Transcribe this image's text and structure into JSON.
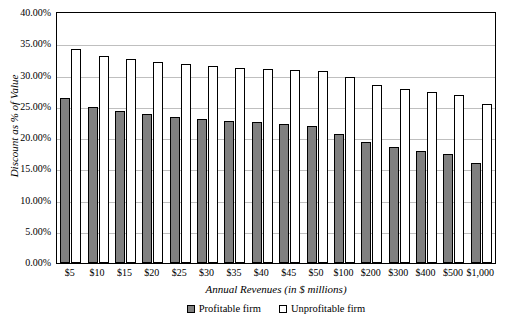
{
  "chart_data": {
    "type": "bar",
    "title": "",
    "xlabel": "Annual Revenues (in $ millions)",
    "ylabel": "Discount as % of Value",
    "categories": [
      "$5",
      "$10",
      "$15",
      "$20",
      "$25",
      "$30",
      "$35",
      "$40",
      "$45",
      "$50",
      "$100",
      "$200",
      "$300",
      "$400",
      "$500",
      "$1,000"
    ],
    "series": [
      {
        "name": "Profitable firm",
        "color": "#808080",
        "values": [
          26.4,
          25.0,
          24.3,
          23.8,
          23.4,
          23.0,
          22.7,
          22.5,
          22.3,
          22.0,
          20.7,
          19.4,
          18.5,
          17.9,
          17.5,
          16.0
        ]
      },
      {
        "name": "Unprofitable firm",
        "color": "#ffffff",
        "values": [
          34.2,
          33.2,
          32.6,
          32.1,
          31.9,
          31.5,
          31.2,
          31.0,
          30.9,
          30.8,
          29.7,
          28.5,
          27.8,
          27.4,
          26.9,
          25.5
        ]
      }
    ],
    "ylim": [
      0,
      40
    ],
    "yticks": [
      "0.00%",
      "5.00%",
      "10.00%",
      "15.00%",
      "20.00%",
      "25.00%",
      "30.00%",
      "35.00%",
      "40.00%"
    ],
    "ytick_values": [
      0,
      5,
      10,
      15,
      20,
      25,
      30,
      35,
      40
    ],
    "grid": true,
    "legend_position": "bottom"
  }
}
